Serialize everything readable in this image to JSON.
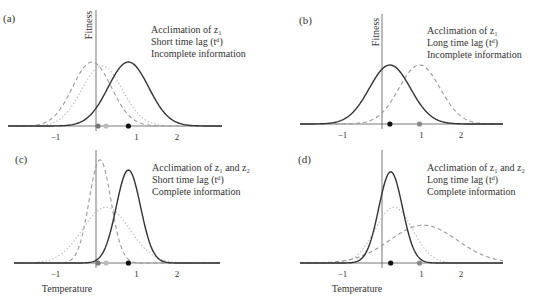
{
  "chart_data": [
    {
      "panel": "(a)",
      "type": "line",
      "title_lines": [
        "Acclimation of z₁",
        "Short time lag (tᵈ)",
        "Incomplete information"
      ],
      "xlabel": "",
      "ylabel": "Fitness",
      "xticks": [
        -1,
        1,
        2
      ],
      "xlim": [
        -2.1,
        3.1
      ],
      "series": [
        {
          "name": "solid (realized fitness)",
          "style": "solid",
          "color": "#333333",
          "mean": 0.8,
          "sd": 0.5,
          "height": 1.0
        },
        {
          "name": "dashed",
          "style": "dashed",
          "color": "#999999",
          "mean": -0.1,
          "sd": 0.48,
          "height": 1.0
        },
        {
          "name": "dotted",
          "style": "dotted",
          "color": "#bbbbbb",
          "mean": 0.15,
          "sd": 0.5,
          "height": 0.94
        }
      ],
      "points": [
        {
          "x": 0.05,
          "color": "#777777"
        },
        {
          "x": 0.25,
          "color": "#bbbbbb"
        },
        {
          "x": 0.8,
          "color": "#111111"
        }
      ]
    },
    {
      "panel": "(b)",
      "type": "line",
      "title_lines": [
        "Acclimation of z₁",
        "Long time lag (tᵈ)",
        "Incomplete information"
      ],
      "xlabel": "",
      "ylabel": "Fitness",
      "xticks": [
        -1,
        1,
        2
      ],
      "xlim": [
        -2.0,
        3.0
      ],
      "series": [
        {
          "name": "solid (realized fitness)",
          "style": "solid",
          "color": "#333333",
          "mean": 0.2,
          "sd": 0.52,
          "height": 1.0
        },
        {
          "name": "dashed",
          "style": "dashed",
          "color": "#999999",
          "mean": 0.95,
          "sd": 0.52,
          "height": 1.0
        }
      ],
      "points": [
        {
          "x": 0.2,
          "color": "#111111"
        },
        {
          "x": 0.95,
          "color": "#888888"
        }
      ]
    },
    {
      "panel": "(c)",
      "type": "line",
      "title_lines": [
        "Acclimation of z₁ and z₂",
        "Short time lag (tᵈ)",
        "Complete information"
      ],
      "xlabel": "Temperature",
      "ylabel": "",
      "xticks": [
        -1,
        1,
        2
      ],
      "xlim": [
        -2.1,
        3.1
      ],
      "series": [
        {
          "name": "solid (realized fitness)",
          "style": "solid",
          "color": "#333333",
          "mean": 0.8,
          "sd": 0.3,
          "height": 1.55
        },
        {
          "name": "dashed",
          "style": "dashed",
          "color": "#999999",
          "mean": 0.1,
          "sd": 0.27,
          "height": 1.72
        },
        {
          "name": "dotted",
          "style": "dotted",
          "color": "#bbbbbb",
          "mean": 0.25,
          "sd": 0.58,
          "height": 0.93
        }
      ],
      "points": [
        {
          "x": 0.05,
          "color": "#777777"
        },
        {
          "x": 0.25,
          "color": "#bbbbbb"
        },
        {
          "x": 0.8,
          "color": "#111111"
        }
      ]
    },
    {
      "panel": "(d)",
      "type": "line",
      "title_lines": [
        "Acclimation of z₁ and z₂",
        "Long time lag (tᵈ)",
        "Complete information"
      ],
      "xlabel": "Temperature",
      "ylabel": "",
      "xticks": [
        -1,
        1,
        2
      ],
      "xlim": [
        -2.0,
        3.0
      ],
      "series": [
        {
          "name": "solid (realized fitness)",
          "style": "solid",
          "color": "#333333",
          "mean": 0.22,
          "sd": 0.3,
          "height": 1.52
        },
        {
          "name": "dotted",
          "style": "dotted",
          "color": "#bbbbbb",
          "mean": 0.3,
          "sd": 0.47,
          "height": 0.93
        },
        {
          "name": "dashed",
          "style": "dashed",
          "color": "#999999",
          "mean": 1.05,
          "sd": 0.85,
          "height": 0.63
        }
      ],
      "points": [
        {
          "x": 0.22,
          "color": "#111111"
        },
        {
          "x": 0.95,
          "color": "#888888"
        }
      ]
    }
  ],
  "panels_layout": [
    {
      "label_pos": [
        3,
        22
      ],
      "origin": [
        96,
        126
      ],
      "unit_px": 40.5,
      "height_px": 64,
      "axis_top": 10,
      "axis_left": 8,
      "axis_right": 222,
      "text_pos": [
        151,
        33
      ],
      "fitness_pos": [
        92,
        25
      ],
      "temp_pos": null
    },
    {
      "label_pos": [
        299,
        24
      ],
      "origin": [
        382,
        124
      ],
      "unit_px": 39.5,
      "height_px": 59,
      "axis_top": 14,
      "axis_left": 300,
      "axis_right": 503,
      "text_pos": [
        427,
        34
      ],
      "fitness_pos": [
        379,
        32
      ],
      "temp_pos": null
    },
    {
      "label_pos": [
        15,
        163
      ],
      "origin": [
        96,
        263
      ],
      "unit_px": 40.5,
      "height_px": 60,
      "axis_top": 150,
      "axis_left": 14,
      "axis_right": 220,
      "text_pos": [
        152,
        171
      ],
      "fitness_pos": null,
      "temp_pos": [
        67,
        292
      ]
    },
    {
      "label_pos": [
        298,
        163
      ],
      "origin": [
        382,
        263
      ],
      "unit_px": 39.5,
      "height_px": 60,
      "axis_top": 150,
      "axis_left": 300,
      "axis_right": 503,
      "text_pos": [
        427,
        171
      ],
      "fitness_pos": null,
      "temp_pos": [
        357,
        292
      ]
    }
  ]
}
